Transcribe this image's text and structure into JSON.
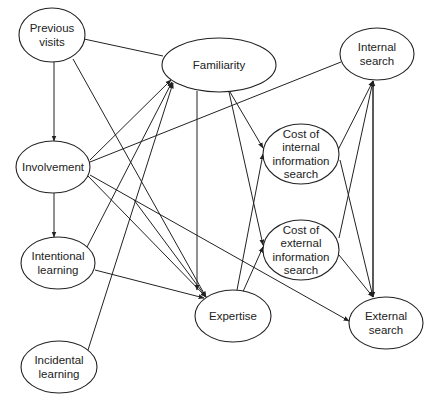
{
  "diagram": {
    "type": "path-model",
    "colors": {
      "stroke": "#222222",
      "background": "#ffffff"
    },
    "nodes": [
      {
        "id": "previous_visits",
        "lines": [
          "Previous",
          "visits"
        ],
        "cx": 52,
        "cy": 35,
        "rx": 33,
        "ry": 27
      },
      {
        "id": "familiarity",
        "lines": [
          "Familiarity"
        ],
        "cx": 219,
        "cy": 65,
        "rx": 57,
        "ry": 27
      },
      {
        "id": "internal_search",
        "lines": [
          "Internal",
          "search"
        ],
        "cx": 377,
        "cy": 54,
        "rx": 37,
        "ry": 26
      },
      {
        "id": "involvement",
        "lines": [
          "Involvement"
        ],
        "cx": 53,
        "cy": 167,
        "rx": 37,
        "ry": 26
      },
      {
        "id": "cost_internal",
        "lines": [
          "Cost of",
          "internal",
          "information",
          "search"
        ],
        "cx": 301,
        "cy": 154,
        "rx": 38,
        "ry": 30
      },
      {
        "id": "intentional_learning",
        "lines": [
          "Intentional",
          "learning"
        ],
        "cx": 58,
        "cy": 263,
        "rx": 37,
        "ry": 26
      },
      {
        "id": "cost_external",
        "lines": [
          "Cost of",
          "external",
          "information",
          "search"
        ],
        "cx": 301,
        "cy": 250,
        "rx": 38,
        "ry": 30
      },
      {
        "id": "expertise",
        "lines": [
          "Expertise"
        ],
        "cx": 233,
        "cy": 316,
        "rx": 38,
        "ry": 26
      },
      {
        "id": "external_search",
        "lines": [
          "External",
          "search"
        ],
        "cx": 386,
        "cy": 323,
        "rx": 37,
        "ry": 26
      },
      {
        "id": "incidental_learning",
        "lines": [
          "Incidental",
          "learning"
        ],
        "cx": 59,
        "cy": 367,
        "rx": 38,
        "ry": 26
      }
    ],
    "edges": [
      {
        "from": "previous_visits",
        "to": "familiarity",
        "arrow": false,
        "x1": 84,
        "y1": 39,
        "x2": 163,
        "y2": 56
      },
      {
        "from": "previous_visits",
        "to": "involvement",
        "arrow": true,
        "x1": 54,
        "y1": 62,
        "x2": 54,
        "y2": 141
      },
      {
        "from": "previous_visits",
        "to": "expertise",
        "arrow": true,
        "x1": 73,
        "y1": 59,
        "x2": 206,
        "y2": 297
      },
      {
        "from": "involvement",
        "to": "familiarity",
        "arrow": true,
        "x1": 90,
        "y1": 160,
        "x2": 171,
        "y2": 80
      },
      {
        "from": "involvement",
        "to": "internal_search",
        "arrow": false,
        "x1": 90,
        "y1": 162,
        "x2": 341,
        "y2": 62
      },
      {
        "from": "involvement",
        "to": "intentional_learning",
        "arrow": true,
        "x1": 54,
        "y1": 193,
        "x2": 54,
        "y2": 237
      },
      {
        "from": "involvement",
        "to": "expertise",
        "arrow": true,
        "x1": 88,
        "y1": 176,
        "x2": 206,
        "y2": 297
      },
      {
        "from": "involvement",
        "to": "external_search",
        "arrow": true,
        "x1": 90,
        "y1": 175,
        "x2": 349,
        "y2": 321
      },
      {
        "from": "involvement",
        "to": "expertise_b",
        "arrow": true,
        "x1": 134,
        "y1": 200,
        "x2": 206,
        "y2": 297
      },
      {
        "from": "intentional_learning",
        "to": "familiarity",
        "arrow": true,
        "x1": 87,
        "y1": 247,
        "x2": 172,
        "y2": 82
      },
      {
        "from": "intentional_learning",
        "to": "expertise",
        "arrow": true,
        "x1": 95,
        "y1": 270,
        "x2": 204,
        "y2": 298
      },
      {
        "from": "incidental_learning",
        "to": "familiarity",
        "arrow": true,
        "x1": 88,
        "y1": 350,
        "x2": 173,
        "y2": 83
      },
      {
        "from": "familiarity",
        "to": "expertise",
        "arrow": true,
        "x1": 197,
        "y1": 91,
        "x2": 197,
        "y2": 290
      },
      {
        "from": "familiarity",
        "to": "cost_internal",
        "arrow": true,
        "x1": 230,
        "y1": 92,
        "x2": 263,
        "y2": 148
      },
      {
        "from": "familiarity",
        "to": "cost_external",
        "arrow": true,
        "x1": 229,
        "y1": 92,
        "x2": 263,
        "y2": 245
      },
      {
        "from": "expertise",
        "to": "cost_internal",
        "arrow": true,
        "x1": 237,
        "y1": 290,
        "x2": 263,
        "y2": 154
      },
      {
        "from": "expertise",
        "to": "cost_external",
        "arrow": true,
        "x1": 237,
        "y1": 305,
        "x2": 263,
        "y2": 247
      },
      {
        "from": "cost_internal",
        "to": "internal_search",
        "arrow": true,
        "x1": 338,
        "y1": 150,
        "x2": 373,
        "y2": 81
      },
      {
        "from": "cost_internal",
        "to": "external_search",
        "arrow": true,
        "x1": 340,
        "y1": 160,
        "x2": 373,
        "y2": 297
      },
      {
        "from": "cost_external",
        "to": "internal_search",
        "arrow": true,
        "x1": 339,
        "y1": 238,
        "x2": 373,
        "y2": 81
      },
      {
        "from": "cost_external",
        "to": "external_search",
        "arrow": true,
        "x1": 339,
        "y1": 255,
        "x2": 373,
        "y2": 297
      },
      {
        "from": "external_search",
        "to": "internal_search",
        "arrow": true,
        "x1": 373,
        "y1": 297,
        "x2": 373,
        "y2": 81
      },
      {
        "from": "internal_search",
        "to": "external_search",
        "arrow": true,
        "x1": 373,
        "y1": 81,
        "x2": 373,
        "y2": 297
      }
    ]
  }
}
